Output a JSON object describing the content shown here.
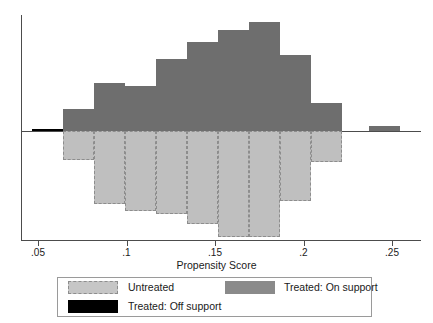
{
  "chart_data": {
    "type": "bar",
    "title": "",
    "xlabel": "Propensity Score",
    "ylabel": "",
    "xlim": [
      0.0375,
      0.26
    ],
    "xticks": [
      0.05,
      0.1,
      0.15,
      0.2,
      0.25
    ],
    "xticklabels": [
      ".05",
      ".1",
      ".15",
      ".2",
      ".25"
    ],
    "grid": false,
    "legend_position": "below-axis",
    "orientation": "back-to-back histogram",
    "note": "Mirrored density histogram: treated bars plotted upward, untreated bars plotted downward from a zero line.",
    "bin_width": 0.0175,
    "x": [
      0.0555,
      0.073,
      0.0905,
      0.108,
      0.1255,
      0.143,
      0.1605,
      0.178,
      0.1955,
      0.213,
      0.2455
    ],
    "series": [
      {
        "name": "Treated: On support",
        "direction": "up",
        "color": "#6e6e6e",
        "values": [
          0,
          22,
          48,
          45,
          72,
          89,
          101,
          109,
          76,
          28,
          5
        ]
      },
      {
        "name": "Untreated",
        "direction": "down",
        "color": "#bfbfbf",
        "border": "dashed",
        "values": [
          0,
          29,
          73,
          80,
          83,
          93,
          106,
          106,
          70,
          31,
          0
        ]
      },
      {
        "name": "Treated: Off support",
        "direction": "up",
        "color": "#000000",
        "values": [
          2,
          0,
          0,
          0,
          0,
          0,
          0,
          0,
          0,
          0,
          0
        ]
      }
    ]
  },
  "axis": {
    "xlabel": "Propensity Score",
    "ticklabels": [
      ".05",
      ".1",
      ".15",
      ".2",
      ".25"
    ]
  },
  "legend": {
    "entries": [
      {
        "label": "Untreated",
        "swatch": "untreated-swatch"
      },
      {
        "label": "Treated: On support",
        "swatch": "on-support-swatch"
      },
      {
        "label": "Treated: Off support",
        "swatch": "off-support-swatch"
      }
    ]
  },
  "colors": {
    "on_support": "#6e6e6e",
    "untreated": "#bfbfbf",
    "off_support": "#000000",
    "axis": "#4c4c4c"
  }
}
